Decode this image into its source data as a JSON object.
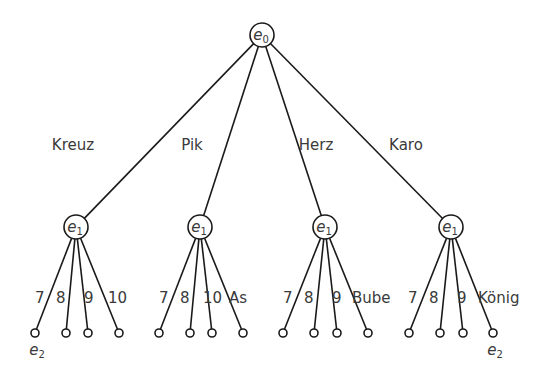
{
  "diagram": {
    "type": "tree",
    "root": {
      "id": "e0",
      "label": "e",
      "subscript": "0",
      "x": 262,
      "y": 35
    },
    "branches": [
      {
        "suit": "Kreuz",
        "suit_label_pos": [
          73,
          150
        ],
        "node": {
          "label": "e",
          "subscript": "1",
          "x": 76,
          "y": 227
        },
        "leaves": [
          {
            "label": "7",
            "x": 35,
            "label_x": 35
          },
          {
            "label": "8",
            "x": 66,
            "label_x": 56
          },
          {
            "label": "9",
            "x": 88,
            "label_x": 84
          },
          {
            "label": "10",
            "x": 119,
            "label_x": 108
          }
        ],
        "leaf_annotation": {
          "text": "e",
          "subscript": "2",
          "leaf_index": 0
        }
      },
      {
        "suit": "Pik",
        "suit_label_pos": [
          192,
          150
        ],
        "node": {
          "label": "e",
          "subscript": "1",
          "x": 200,
          "y": 227
        },
        "leaves": [
          {
            "label": "7",
            "x": 159,
            "label_x": 159
          },
          {
            "label": "8",
            "x": 190,
            "label_x": 180
          },
          {
            "label": "10",
            "x": 212,
            "label_x": 203
          },
          {
            "label": "As",
            "x": 243,
            "label_x": 229
          }
        ]
      },
      {
        "suit": "Herz",
        "suit_label_pos": [
          316,
          150
        ],
        "node": {
          "label": "e",
          "subscript": "1",
          "x": 325,
          "y": 227
        },
        "leaves": [
          {
            "label": "7",
            "x": 283,
            "label_x": 283
          },
          {
            "label": "8",
            "x": 314,
            "label_x": 304
          },
          {
            "label": "9",
            "x": 337,
            "label_x": 332
          },
          {
            "label": "Bube",
            "x": 368,
            "label_x": 352
          }
        ]
      },
      {
        "suit": "Karo",
        "suit_label_pos": [
          406,
          150
        ],
        "node": {
          "label": "e",
          "subscript": "1",
          "x": 451,
          "y": 227
        },
        "leaves": [
          {
            "label": "7",
            "x": 409,
            "label_x": 408
          },
          {
            "label": "8",
            "x": 440,
            "label_x": 429
          },
          {
            "label": "9",
            "x": 463,
            "label_x": 457
          },
          {
            "label": "König",
            "x": 493,
            "label_x": 478
          }
        ],
        "leaf_annotation": {
          "text": "e",
          "subscript": "2",
          "leaf_index": 3
        }
      }
    ],
    "leaf_y": 333,
    "leaf_label_y": 303,
    "node_radius": 12,
    "leaf_radius": 4
  }
}
